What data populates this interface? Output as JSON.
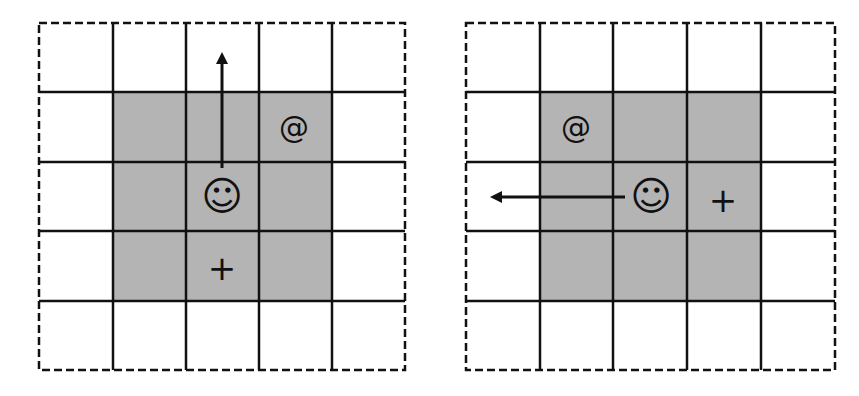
{
  "panels": [
    {
      "name": "left",
      "grid": {
        "rows": 5,
        "cols": 5,
        "shaded": "inner 3x3"
      },
      "symbols": {
        "agent": "☺",
        "target_at": "@",
        "target_plus": "+"
      },
      "agent_cell": [
        2,
        2
      ],
      "at_cell": [
        1,
        3
      ],
      "plus_cell": [
        3,
        2
      ],
      "arrow_direction": "up"
    },
    {
      "name": "right",
      "grid": {
        "rows": 5,
        "cols": 5,
        "shaded": "inner 3x3"
      },
      "symbols": {
        "agent": "☺",
        "target_at": "@",
        "target_plus": "+"
      },
      "agent_cell": [
        2,
        2
      ],
      "at_cell": [
        1,
        1
      ],
      "plus_cell": [
        2,
        3
      ],
      "arrow_direction": "left"
    }
  ],
  "colors": {
    "shade": "#b4b4b4",
    "line": "#111111",
    "background": "#ffffff"
  }
}
